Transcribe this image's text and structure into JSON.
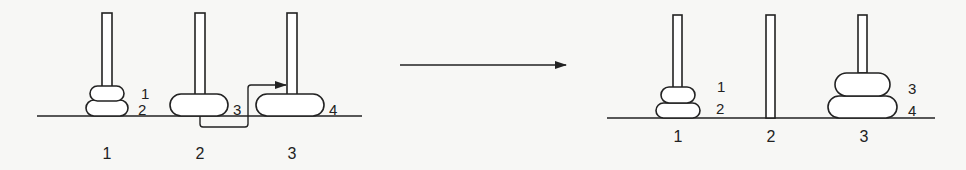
{
  "before": {
    "pegs": [
      {
        "label": "1"
      },
      {
        "label": "2"
      },
      {
        "label": "3"
      }
    ],
    "disks": [
      {
        "label": "1",
        "peg": "1"
      },
      {
        "label": "2",
        "peg": "1"
      },
      {
        "label": "3",
        "peg": "2"
      },
      {
        "label": "4",
        "peg": "3"
      }
    ],
    "move": {
      "from_disk": "3",
      "to_peg": "3"
    }
  },
  "transition_arrow": "right-arrow",
  "after": {
    "pegs": [
      {
        "label": "1"
      },
      {
        "label": "2"
      },
      {
        "label": "3"
      }
    ],
    "disks": [
      {
        "label": "1",
        "peg": "1"
      },
      {
        "label": "2",
        "peg": "1"
      },
      {
        "label": "3",
        "peg": "3"
      },
      {
        "label": "4",
        "peg": "3"
      }
    ]
  }
}
